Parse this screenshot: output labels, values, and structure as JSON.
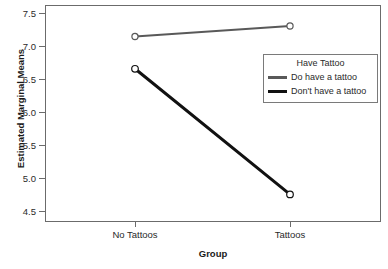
{
  "chart_data": {
    "type": "line",
    "title": "",
    "xlabel": "Group",
    "ylabel": "Estimated Marginal Means",
    "categories": [
      "No Tattoos",
      "Tattoos"
    ],
    "ylim": [
      4.35,
      7.65
    ],
    "yticks": [
      4.5,
      5.0,
      5.5,
      6.0,
      6.5,
      7.0,
      7.5
    ],
    "ytick_labels": [
      "4.5",
      "5.0",
      "5.5",
      "6.0",
      "6.5",
      "7.0",
      "7.5"
    ],
    "grid": false,
    "legend_position": "center-right",
    "legend_title": "Have Tattoo",
    "series": [
      {
        "name": "Do have a tattoo",
        "values": [
          7.17,
          7.33
        ],
        "color": "#595959",
        "line_width": 2,
        "marker": "open-circle"
      },
      {
        "name": "Don't have a tattoo",
        "values": [
          6.68,
          4.77
        ],
        "color": "#111111",
        "line_width": 3,
        "marker": "open-circle"
      }
    ]
  },
  "axes": {
    "y_title": "Estimated Marginal Means",
    "x_title": "Group",
    "y_tick_labels": [
      "7.5",
      "7.0",
      "6.5",
      "6.0",
      "5.5",
      "5.0",
      "4.5"
    ],
    "x_tick_labels": [
      "No Tattoos",
      "Tattoos"
    ]
  },
  "legend": {
    "title": "Have Tattoo",
    "entries": [
      {
        "label": "Do have a tattoo",
        "color": "#595959"
      },
      {
        "label": "Don't have a tattoo",
        "color": "#111111"
      }
    ]
  },
  "colors": {
    "frame": "#6b6b6b",
    "text": "#2a2a2a",
    "background": "#ffffff",
    "series_gray": "#595959",
    "series_black": "#111111"
  }
}
